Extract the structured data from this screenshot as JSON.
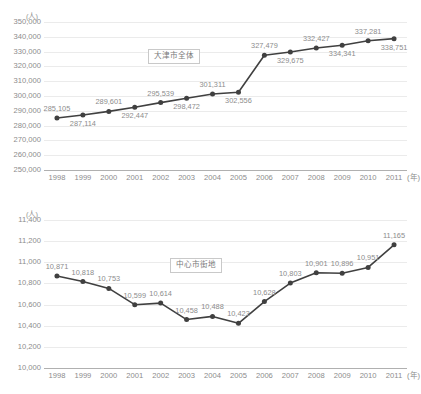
{
  "charts": [
    {
      "id": "chart-top",
      "unit_label": "(人)",
      "legend_label": "大津市全体",
      "xaxis_unit": "(年)",
      "chart_data": {
        "type": "line",
        "title": "",
        "subtitle": "",
        "xlabel": "(年)",
        "ylabel": "(人)",
        "legend": [
          "大津市全体"
        ],
        "legend_position": "inside-top-center",
        "grid": true,
        "ylim": [
          250000,
          350000
        ],
        "ytick_step": 10000,
        "ytick_labels": [
          "250,000",
          "260,000",
          "270,000",
          "280,000",
          "290,000",
          "300,000",
          "310,000",
          "320,000",
          "330,000",
          "340,000",
          "350,000"
        ],
        "categories": [
          "1998",
          "1999",
          "2000",
          "2001",
          "2002",
          "2003",
          "2004",
          "2005",
          "2006",
          "2007",
          "2008",
          "2009",
          "2010",
          "2011"
        ],
        "values": [
          285105,
          287114,
          289601,
          292447,
          295539,
          298472,
          301311,
          302556,
          327479,
          329675,
          332427,
          334341,
          337281,
          338751
        ],
        "value_labels": [
          "285,105",
          "287,114",
          "289,601",
          "292,447",
          "295,539",
          "298,472",
          "301,311",
          "302,556",
          "327,479",
          "329,675",
          "332,427",
          "334,341",
          "337,281",
          "338,751"
        ],
        "label_positions": [
          "above",
          "below",
          "above",
          "below",
          "above",
          "below",
          "above",
          "below",
          "above",
          "below",
          "above",
          "below",
          "above",
          "below"
        ],
        "series_color": "#404040"
      }
    },
    {
      "id": "chart-bottom",
      "unit_label": "(人)",
      "legend_label": "中心市街地",
      "xaxis_unit": "(年)",
      "chart_data": {
        "type": "line",
        "title": "",
        "subtitle": "",
        "xlabel": "(年)",
        "ylabel": "(人)",
        "legend": [
          "中心市街地"
        ],
        "legend_position": "inside-top-center",
        "grid": true,
        "ylim": [
          10000,
          11400
        ],
        "ytick_step": 200,
        "ytick_labels": [
          "10,000",
          "10,200",
          "10,400",
          "10,600",
          "10,800",
          "11,000",
          "11,200",
          "11,400"
        ],
        "categories": [
          "1998",
          "1999",
          "2000",
          "2001",
          "2002",
          "2003",
          "2004",
          "2005",
          "2006",
          "2007",
          "2008",
          "2009",
          "2010",
          "2011"
        ],
        "values": [
          10871,
          10818,
          10753,
          10599,
          10614,
          10458,
          10488,
          10423,
          10628,
          10803,
          10901,
          10896,
          10951,
          11165
        ],
        "value_labels": [
          "10,871",
          "10,818",
          "10,753",
          "10,599",
          "10,614",
          "10,458",
          "10,488",
          "10,423",
          "10,628",
          "10,803",
          "10,901",
          "10,896",
          "10,951",
          "11,165"
        ],
        "label_positions": [
          "above",
          "above",
          "above",
          "above",
          "above",
          "above",
          "above",
          "above",
          "above",
          "above",
          "above",
          "above",
          "above",
          "above"
        ],
        "series_color": "#404040"
      }
    }
  ],
  "colors": {
    "series": "#404040",
    "gridline": "#ebebeb",
    "axis": "#b0b0b0",
    "text": "#8c8c8c"
  }
}
